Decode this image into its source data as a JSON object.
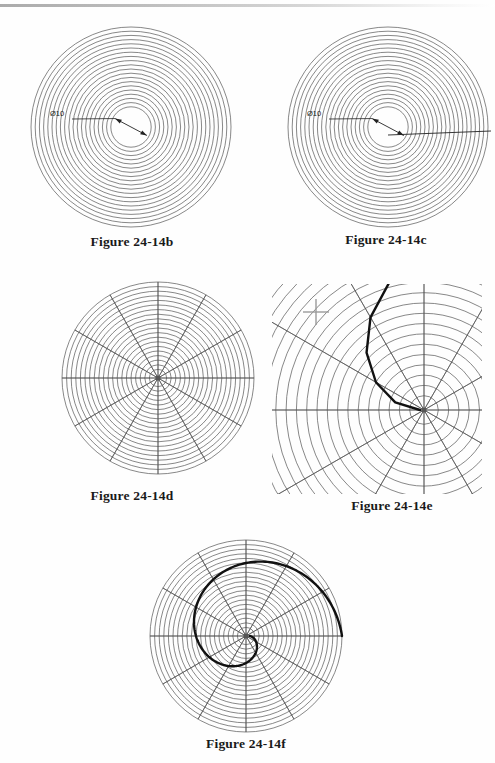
{
  "page": {
    "width": 495,
    "height": 763,
    "background_color": "#fefefe",
    "scan_edge_visible": true
  },
  "styles": {
    "grid_line_color": "#555555",
    "grid_line_width": 0.7,
    "spiral_line_color": "#111111",
    "spiral_line_width": 2.4,
    "dimension_line_color": "#222222",
    "caption_color": "#1a1a1a"
  },
  "figures": [
    {
      "id": "fig-24-14b",
      "caption": "Figure 24-14b",
      "kind": "concentric-circles",
      "x": 28,
      "y": 24,
      "size": 206,
      "center": {
        "cx": 103,
        "cy": 103
      },
      "outer_radius": 100,
      "circle_count": 20,
      "inner_radius": 16,
      "radial_spokes": 0,
      "dimension": {
        "label": "Ø10",
        "label_x": 22,
        "label_y": 92,
        "leader_from": {
          "x": 44,
          "y": 95
        },
        "leader_to": {
          "x": 67,
          "y": 95
        },
        "diameter_line_angle_deg": 28,
        "arrowheads": 2
      },
      "spiral": null,
      "horizontal_ray": false,
      "crosshair": null
    },
    {
      "id": "fig-24-14c",
      "caption": "Figure 24-14c",
      "kind": "concentric-circles",
      "x": 285,
      "y": 24,
      "size": 206,
      "center": {
        "cx": 103,
        "cy": 103
      },
      "outer_radius": 100,
      "circle_count": 20,
      "inner_radius": 16,
      "radial_spokes": 0,
      "dimension": {
        "label": "Ø10",
        "label_x": 22,
        "label_y": 92,
        "leader_from": {
          "x": 44,
          "y": 95
        },
        "leader_to": {
          "x": 67,
          "y": 95
        },
        "diameter_line_angle_deg": 28,
        "arrowheads": 2
      },
      "spiral": null,
      "horizontal_ray": true,
      "crosshair": null
    },
    {
      "id": "fig-24-14d",
      "caption": "Figure 24-14d",
      "kind": "polar-grid",
      "x": 58,
      "y": 278,
      "size": 200,
      "center": {
        "cx": 100,
        "cy": 100
      },
      "outer_radius": 96,
      "circle_count": 20,
      "inner_radius": 4,
      "radial_spokes": 12,
      "dimension": null,
      "spiral": null,
      "horizontal_ray": false,
      "crosshair": null
    },
    {
      "id": "fig-24-14e",
      "caption": "Figure 24-14e",
      "kind": "polar-grid-zoom",
      "x": 272,
      "y": 284,
      "size": 210,
      "center": {
        "cx": 152,
        "cy": 126
      },
      "outer_radius": 210,
      "circle_count": 20,
      "inner_radius": 4,
      "radial_spokes": 12,
      "dimension": null,
      "spiral": {
        "type": "polyline-partial",
        "turns": 0.5,
        "start_angle_deg": 180,
        "end_angle_deg": 300,
        "points": 8
      },
      "horizontal_ray": false,
      "crosshair": {
        "x": 44,
        "y": 28,
        "arm": 13
      }
    },
    {
      "id": "fig-24-14f",
      "caption": "Figure 24-14f",
      "kind": "polar-grid-spiral",
      "x": 146,
      "y": 536,
      "size": 200,
      "center": {
        "cx": 100,
        "cy": 100
      },
      "outer_radius": 96,
      "circle_count": 20,
      "inner_radius": 4,
      "radial_spokes": 12,
      "dimension": null,
      "spiral": {
        "type": "archimedean-full",
        "turns": 1.0,
        "start_angle_deg": 0,
        "end_angle_deg": 360,
        "points": 200
      },
      "horizontal_ray": false,
      "crosshair": null
    }
  ],
  "captions": [
    {
      "text": "Figure 24-14b",
      "x": 62,
      "y": 234,
      "width": 140
    },
    {
      "text": "Figure 24-14c",
      "x": 316,
      "y": 232,
      "width": 140
    },
    {
      "text": "Figure 24-14d",
      "x": 62,
      "y": 488,
      "width": 140
    },
    {
      "text": "Figure 24-14e",
      "x": 322,
      "y": 498,
      "width": 140
    },
    {
      "text": "Figure 24-14f",
      "x": 176,
      "y": 736,
      "width": 140
    }
  ]
}
